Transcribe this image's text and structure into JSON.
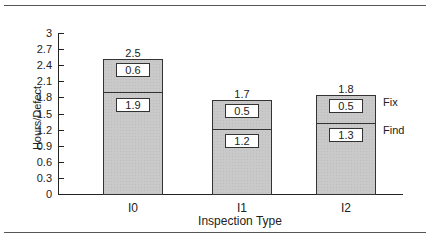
{
  "chart_data": {
    "type": "bar",
    "stacked": true,
    "title": "",
    "xlabel": "Inspection Type",
    "ylabel": "Hours/Defect",
    "ylim": [
      0,
      3
    ],
    "yticks": [
      "0",
      "0.3",
      "0.6",
      "0.9",
      "1.2",
      "1.5",
      "1.8",
      "2.1",
      "2.4",
      "2.7",
      "3"
    ],
    "categories": [
      "I0",
      "I1",
      "I2"
    ],
    "series": [
      {
        "name": "Find",
        "values": [
          1.9,
          1.2,
          1.3
        ]
      },
      {
        "name": "Fix",
        "values": [
          0.6,
          0.5,
          0.5
        ]
      }
    ],
    "totals": [
      2.5,
      1.7,
      1.8
    ],
    "legend": {
      "position": "right, inline beside I2 bar",
      "entries": [
        "Fix",
        "Find"
      ]
    },
    "grid": false
  },
  "labels": {
    "ylabel": "Hours/Defect",
    "xlabel": "Inspection Type",
    "legend_fix": "Fix",
    "legend_find": "Find",
    "bars": [
      {
        "cat": "I0",
        "total": "2.5",
        "fix": "0.6",
        "find": "1.9"
      },
      {
        "cat": "I1",
        "total": "1.7",
        "fix": "0.5",
        "find": "1.2"
      },
      {
        "cat": "I2",
        "total": "1.8",
        "fix": "0.5",
        "find": "1.3"
      }
    ]
  }
}
